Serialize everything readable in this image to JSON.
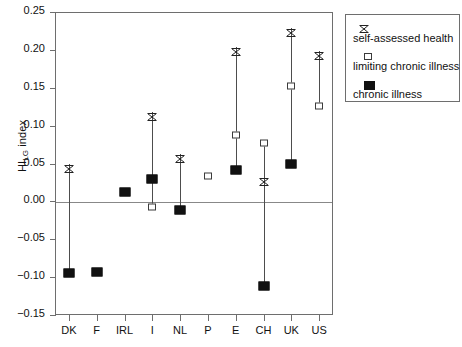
{
  "chart_data": {
    "type": "scatter",
    "title": "",
    "xlabel": "",
    "ylabel": "HI_LG index",
    "ylabel_base": "HI",
    "ylabel_sub": "LG",
    "ylabel_tail": " index",
    "ylim": [
      -0.15,
      0.25
    ],
    "ytick_labels": [
      "0.25",
      "0.20",
      "0.15",
      "0.10",
      "0.05",
      "0.00",
      "-0.05",
      "-0.10",
      "-0.15"
    ],
    "ytick_values": [
      0.25,
      0.2,
      0.15,
      0.1,
      0.05,
      0.0,
      -0.05,
      -0.1,
      -0.15
    ],
    "grid": false,
    "zero_reference_line": 0.0,
    "categories": [
      "DK",
      "F",
      "IRL",
      "I",
      "NL",
      "P",
      "E",
      "CH",
      "UK",
      "US"
    ],
    "legend_position": "outside-top-right",
    "series": [
      {
        "name": "self-assessed health",
        "marker": "cross",
        "values": [
          0.05,
          null,
          null,
          0.118,
          0.063,
          null,
          0.204,
          0.032,
          0.229,
          0.199
        ]
      },
      {
        "name": "limiting chronic illness",
        "marker": "open-square",
        "values": [
          null,
          null,
          null,
          -0.008,
          null,
          0.034,
          0.087,
          0.077,
          0.152,
          0.126
        ]
      },
      {
        "name": "chronic illness",
        "marker": "filled-square",
        "values": [
          -0.095,
          -0.093,
          0.013,
          0.03,
          -0.012,
          null,
          0.041,
          -0.112,
          0.05,
          null
        ]
      }
    ]
  },
  "legend": {
    "entries": [
      {
        "label": "self-assessed health",
        "symbol": "cross-marker-icon"
      },
      {
        "label": "limiting chronic illness",
        "symbol": "open-square-marker-icon"
      },
      {
        "label": "chronic illness",
        "symbol": "filled-square-marker-icon"
      }
    ]
  },
  "colors": {
    "axis": "#6e6e6e",
    "marker": "#111111",
    "line": "#4d4d4d",
    "background": "#ffffff"
  }
}
